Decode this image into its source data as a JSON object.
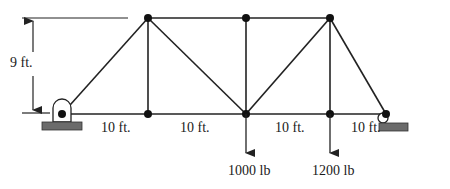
{
  "diagram": {
    "type": "truss",
    "height_label": "9 ft.",
    "span_labels": [
      "10 ft.",
      "10 ft.",
      "10 ft.",
      "10 ft."
    ],
    "loads": [
      {
        "label": "1000 lb",
        "node": "bottom-center"
      },
      {
        "label": "1200 lb",
        "node": "bottom-right-interior"
      }
    ],
    "supports": {
      "left": "pin",
      "right": "roller"
    },
    "colors": {
      "member": "#222222",
      "node": "#111111",
      "ground": "#6b6b6b"
    }
  }
}
